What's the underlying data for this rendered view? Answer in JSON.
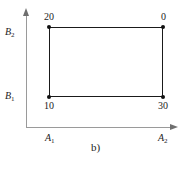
{
  "figure": {
    "caption": "b)",
    "axes": {
      "x_labels": [
        {
          "text": "A",
          "sub": "1"
        },
        {
          "text": "A",
          "sub": "2"
        }
      ],
      "y_labels": [
        {
          "text": "B",
          "sub": "1"
        },
        {
          "text": "B",
          "sub": "2"
        }
      ]
    },
    "vertex_values": {
      "top_left": "20",
      "top_right": "0",
      "bottom_left": "10",
      "bottom_right": "30"
    },
    "colors": {
      "rect_stroke": "#1a1a1a",
      "axis": "#9a9a9a",
      "vertex": "#111111",
      "text": "#1c1c1c",
      "background": "#ffffff"
    }
  },
  "chart_data": {
    "type": "scatter",
    "title": "b)",
    "xlabel": "",
    "ylabel": "",
    "grid": false,
    "legend": null,
    "x": [
      "A1",
      "A2"
    ],
    "categories": [
      "B1",
      "B2"
    ],
    "xtick_labels": [
      "A1",
      "A2"
    ],
    "ytick_labels": [
      "B1",
      "B2"
    ],
    "annotations": [
      {
        "point": "A1,B2",
        "label": "20",
        "position": "above-left"
      },
      {
        "point": "A2,B2",
        "label": "0",
        "position": "above-right"
      },
      {
        "point": "A1,B1",
        "label": "10",
        "position": "below-left"
      },
      {
        "point": "A2,B1",
        "label": "30",
        "position": "below-right"
      }
    ],
    "series": [
      {
        "name": "interaction-rectangle",
        "points": [
          {
            "x": "A1",
            "y": "B2",
            "value": 20
          },
          {
            "x": "A2",
            "y": "B2",
            "value": 0
          },
          {
            "x": "A2",
            "y": "B1",
            "value": 30
          },
          {
            "x": "A1",
            "y": "B1",
            "value": 10
          }
        ],
        "closed": true
      }
    ]
  }
}
